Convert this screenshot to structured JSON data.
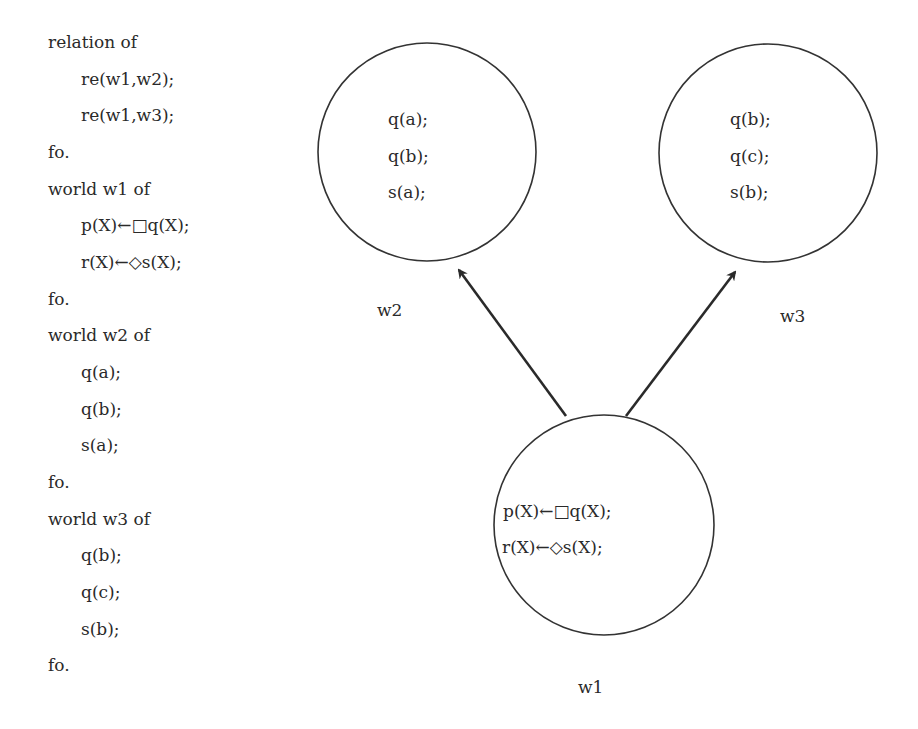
{
  "program": {
    "lines": [
      {
        "text": "relation of",
        "indent": false
      },
      {
        "text": "re(w1,w2);",
        "indent": true
      },
      {
        "text": "re(w1,w3);",
        "indent": true
      },
      {
        "text": "fo.",
        "indent": false
      },
      {
        "text": "world w1 of",
        "indent": false
      },
      {
        "text": "p(X)←□q(X);",
        "indent": true
      },
      {
        "text": "r(X)←◇s(X);",
        "indent": true
      },
      {
        "text": "fo.",
        "indent": false
      },
      {
        "text": "world w2 of",
        "indent": false
      },
      {
        "text": "q(a);",
        "indent": true
      },
      {
        "text": "q(b);",
        "indent": true
      },
      {
        "text": "s(a);",
        "indent": true
      },
      {
        "text": "fo.",
        "indent": false
      },
      {
        "text": "world w3 of",
        "indent": false
      },
      {
        "text": "q(b);",
        "indent": true
      },
      {
        "text": "q(c);",
        "indent": true
      },
      {
        "text": "s(b);",
        "indent": true
      },
      {
        "text": "fo.",
        "indent": false
      }
    ]
  },
  "diagram": {
    "worlds": {
      "w1": {
        "label": "w1",
        "facts": [
          "p(X)←□q(X);",
          "r(X)←◇s(X);"
        ]
      },
      "w2": {
        "label": "w2",
        "facts": [
          "q(a);",
          "q(b);",
          "s(a);"
        ]
      },
      "w3": {
        "label": "w3",
        "facts": [
          "q(b);",
          "q(c);",
          "s(b);"
        ]
      }
    },
    "edges": [
      {
        "from": "w1",
        "to": "w2"
      },
      {
        "from": "w1",
        "to": "w3"
      }
    ]
  }
}
